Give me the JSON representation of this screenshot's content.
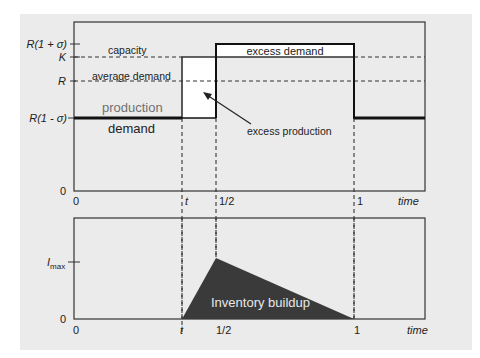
{
  "top_chart": {
    "y_ticks": {
      "r_high": "R(1 + σ)",
      "k": "K",
      "r": "R",
      "r_low": "R(1 - σ)",
      "zero": "0"
    },
    "x_ticks": {
      "zero": "0",
      "t": "t",
      "half": "1/2",
      "one": "1",
      "axis_label": "time"
    },
    "labels": {
      "capacity": "capacity",
      "average_demand": "average demand",
      "production": "production",
      "demand": "demand",
      "excess_demand": "excess demand",
      "excess_production": "excess production"
    }
  },
  "bottom_chart": {
    "y_ticks": {
      "imax_main": "I",
      "imax_sub": "max",
      "zero": "0"
    },
    "x_ticks": {
      "zero": "0",
      "t": "t",
      "half": "1/2",
      "one": "1",
      "axis_label": "time"
    },
    "labels": {
      "inventory": "Inventory buildup"
    }
  },
  "colors": {
    "panel_bg": "#ebebeb",
    "frame": "#333333",
    "inventory_fill": "#3a3a3a",
    "production_text": "#707070"
  }
}
